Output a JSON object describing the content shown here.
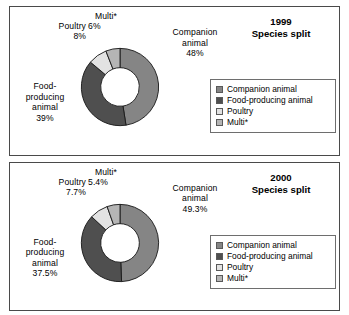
{
  "colors": {
    "companion_animal": "#858585",
    "food_producing_animal": "#4f4f4f",
    "poultry": "#e2e2e2",
    "multi": "#b5b5b5",
    "segment_outline": "#1a1a1a",
    "panel_border": "#4a4a4a",
    "legend_border": "#6e6e6e",
    "background": "#ffffff",
    "text": "#000000"
  },
  "panels": [
    {
      "title_line1": "1999",
      "title_line2": "Species split",
      "labels": {
        "multi_name": "Multi*",
        "multi_value": "6%",
        "poultry_name": "Poultry",
        "poultry_value": "8%",
        "companion_name_line1": "Companion",
        "companion_name_line2": "animal",
        "companion_value": "48%",
        "food_name_line1": "Food-",
        "food_name_line2": "producing",
        "food_name_line3": "animal",
        "food_value": "39%"
      },
      "legend": [
        {
          "label": "Companion animal",
          "color": "#858585"
        },
        {
          "label": "Food-producing animal",
          "color": "#4f4f4f"
        },
        {
          "label": "Poultry",
          "color": "#e2e2e2"
        },
        {
          "label": "Multi*",
          "color": "#b5b5b5"
        }
      ]
    },
    {
      "title_line1": "2000",
      "title_line2": "Species split",
      "labels": {
        "multi_name": "Multi*",
        "multi_value": "5.4%",
        "poultry_name": "Poultry",
        "poultry_value": "7.7%",
        "companion_name_line1": "Companion",
        "companion_name_line2": "animal",
        "companion_value": "49.3%",
        "food_name_line1": "Food-",
        "food_name_line2": "producing",
        "food_name_line3": "animal",
        "food_value": "37.5%"
      },
      "legend": [
        {
          "label": "Companion animal",
          "color": "#858585"
        },
        {
          "label": "Food-producing animal",
          "color": "#4f4f4f"
        },
        {
          "label": "Poultry",
          "color": "#e2e2e2"
        },
        {
          "label": "Multi*",
          "color": "#b5b5b5"
        }
      ]
    }
  ],
  "chart_data": [
    {
      "type": "pie",
      "variant": "donut",
      "title": "1999 Species split",
      "categories": [
        "Companion animal",
        "Food-producing animal",
        "Poultry",
        "Multi*"
      ],
      "values": [
        48,
        39,
        8,
        6
      ],
      "value_labels": [
        "48%",
        "39%",
        "8%",
        "6%"
      ],
      "unit": "percent",
      "colors": [
        "#858585",
        "#4f4f4f",
        "#e2e2e2",
        "#b5b5b5"
      ],
      "start_angle_deg": 0,
      "direction": "clockwise",
      "inner_radius_ratio": 0.5,
      "legend_position": "right",
      "grid": false
    },
    {
      "type": "pie",
      "variant": "donut",
      "title": "2000 Species split",
      "categories": [
        "Companion animal",
        "Food-producing animal",
        "Poultry",
        "Multi*"
      ],
      "values": [
        49.3,
        37.5,
        7.7,
        5.4
      ],
      "value_labels": [
        "49.3%",
        "37.5%",
        "7.7%",
        "5.4%"
      ],
      "unit": "percent",
      "colors": [
        "#858585",
        "#4f4f4f",
        "#e2e2e2",
        "#b5b5b5"
      ],
      "start_angle_deg": 0,
      "direction": "clockwise",
      "inner_radius_ratio": 0.5,
      "legend_position": "right",
      "grid": false
    }
  ]
}
